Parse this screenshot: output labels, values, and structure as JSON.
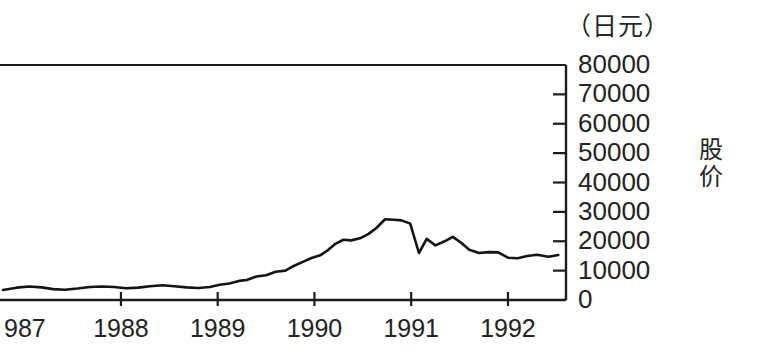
{
  "figure": {
    "unit_label": "（日元）",
    "axis_title_right": "股价"
  },
  "chart_data": {
    "type": "line",
    "title": "",
    "subtitle": "",
    "xlabel": "",
    "ylabel": "股价",
    "unit": "（日元）",
    "grid": false,
    "legend": false,
    "legend_position": "none",
    "xlim": [
      1986.75,
      1992.6
    ],
    "ylim": [
      0,
      80000
    ],
    "ytick_labels": [
      "80000",
      "70000",
      "60000",
      "50000",
      "40000",
      "30000",
      "20000",
      "10000",
      "0"
    ],
    "ytick_values": [
      80000,
      70000,
      60000,
      50000,
      40000,
      30000,
      20000,
      10000,
      0
    ],
    "xtick_labels": [
      "987",
      "1988",
      "1989",
      "1990",
      "1991",
      "1992"
    ],
    "xtick_values": [
      1987,
      1988,
      1989,
      1990,
      1991,
      1992
    ],
    "series": [
      {
        "name": "股价",
        "x": [
          1986.78,
          1986.92,
          1987.05,
          1987.18,
          1987.3,
          1987.42,
          1987.55,
          1987.68,
          1987.8,
          1987.93,
          1988.05,
          1988.18,
          1988.3,
          1988.43,
          1988.55,
          1988.68,
          1988.8,
          1988.92,
          1989.02,
          1989.12,
          1989.22,
          1989.3,
          1989.4,
          1989.5,
          1989.6,
          1989.7,
          1989.78,
          1989.88,
          1989.97,
          1990.06,
          1990.14,
          1990.22,
          1990.3,
          1990.38,
          1990.47,
          1990.56,
          1990.64,
          1990.73,
          1990.82,
          1990.9,
          1990.99,
          1991.08,
          1991.16,
          1991.25,
          1991.34,
          1991.43,
          1991.52,
          1991.6,
          1991.7,
          1991.8,
          1991.9,
          1992.0,
          1992.1,
          1992.2,
          1992.3,
          1992.42,
          1992.52
        ],
        "y": [
          3400,
          4200,
          4600,
          4300,
          3700,
          3500,
          3900,
          4400,
          4600,
          4400,
          4000,
          4200,
          4700,
          5000,
          4700,
          4300,
          4100,
          4400,
          5200,
          5600,
          6500,
          6800,
          8000,
          8400,
          9600,
          10000,
          11500,
          13000,
          14300,
          15200,
          17000,
          19200,
          20500,
          20300,
          21000,
          22500,
          24500,
          27500,
          27300,
          27100,
          26000,
          16000,
          20800,
          18600,
          19900,
          21500,
          19400,
          17100,
          16000,
          16300,
          16200,
          14400,
          14200,
          15000,
          15400,
          14700,
          15300
        ]
      }
    ],
    "annotations": {
      "peak_value": 27500,
      "peak_x": 1989.88,
      "trough_after_peak": 16000,
      "end_value": 15300
    }
  },
  "yticks": [
    {
      "label": "80000",
      "value": 80000
    },
    {
      "label": "70000",
      "value": 70000
    },
    {
      "label": "60000",
      "value": 60000
    },
    {
      "label": "50000",
      "value": 50000
    },
    {
      "label": "40000",
      "value": 40000
    },
    {
      "label": "30000",
      "value": 30000
    },
    {
      "label": "20000",
      "value": 20000
    },
    {
      "label": "10000",
      "value": 10000
    },
    {
      "label": "0",
      "value": 0
    }
  ],
  "xticks": [
    {
      "label": "987",
      "value": 1987
    },
    {
      "label": "1988",
      "value": 1988
    },
    {
      "label": "1989",
      "value": 1989
    },
    {
      "label": "1990",
      "value": 1990
    },
    {
      "label": "1991",
      "value": 1991
    },
    {
      "label": "1992",
      "value": 1992
    }
  ],
  "colors": {
    "background": "#ffffff",
    "line": "#141414",
    "axis": "#1c1c1c",
    "text": "#232323"
  }
}
